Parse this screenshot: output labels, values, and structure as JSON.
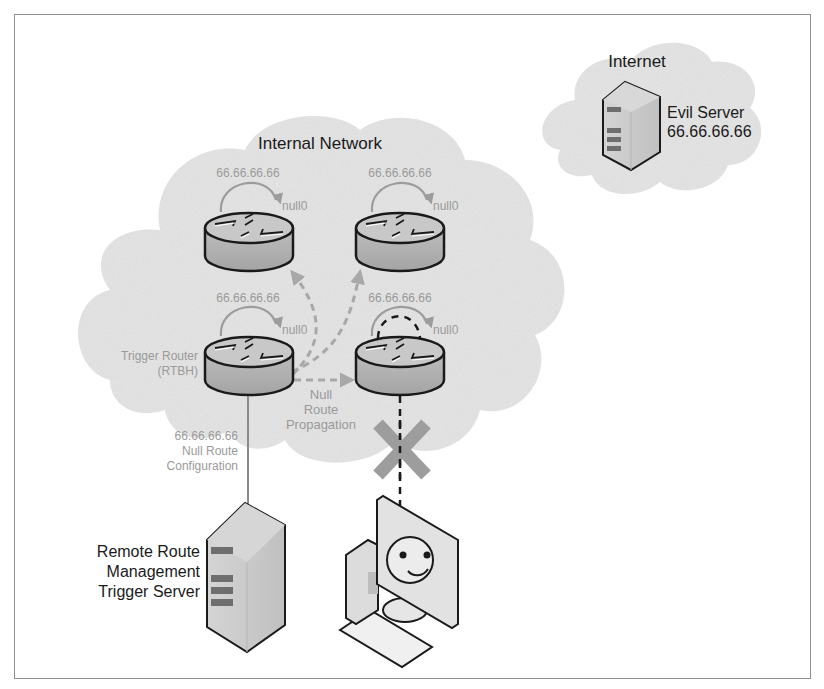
{
  "diagram": {
    "type": "network-diagram",
    "colors": {
      "cloud_fill": "#e4e4e4",
      "router_top": "#c8c8c8",
      "router_body": "#a9a9a9",
      "outline": "#1a1a1a",
      "grey_label": "#9a9a9a",
      "arrow_grey": "#a8a8a8",
      "block_x": "#9d9d9d",
      "frame": "#8f8f8f"
    },
    "clouds": {
      "internet": {
        "label": "Internet"
      },
      "internal": {
        "label": "Internal Network"
      }
    },
    "evil_server": {
      "name": "Evil Server",
      "ip": "66.66.66.66"
    },
    "routers": [
      {
        "id": "top-left",
        "route_ip": "66.66.66.66",
        "route_target": "null0"
      },
      {
        "id": "top-right",
        "route_ip": "66.66.66.66",
        "route_target": "null0"
      },
      {
        "id": "trigger",
        "route_ip": "66.66.66.66",
        "route_target": "null0",
        "label_line1": "Trigger Router",
        "label_line2": "(RTBH)"
      },
      {
        "id": "bottom-right",
        "route_ip": "66.66.66.66",
        "route_target": "null0"
      }
    ],
    "propagation_label": {
      "line1": "Null",
      "line2": "Route",
      "line3": "Propagation"
    },
    "config_label": {
      "line1": "66.66.66.66",
      "line2": "Null Route",
      "line3": "Configuration"
    },
    "trigger_server": {
      "line1": "Remote Route",
      "line2": "Management",
      "line3": "Trigger Server"
    },
    "client": {
      "icon": "happy-workstation",
      "status": "blocked-from-evil-server"
    }
  }
}
